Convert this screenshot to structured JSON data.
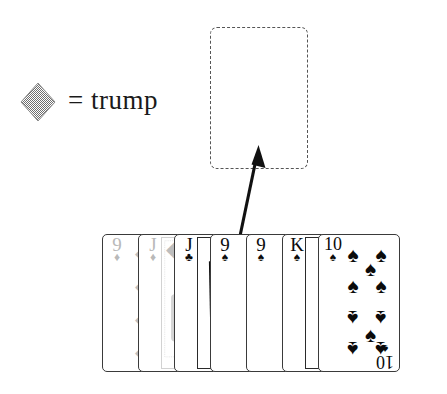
{
  "figure": {
    "legend": {
      "symbol_name": "diamond-suit",
      "symbol_char": "♦",
      "symbol_color": "#9e9e9e",
      "text": "= trump"
    },
    "placeholder": {
      "label": "",
      "style": "dashed-rounded-rectangle",
      "meaning": "empty card slot"
    },
    "arrow": {
      "label": "",
      "direction": "up",
      "from_card_index": 3,
      "points_to": "placeholder"
    },
    "hand": {
      "label": "",
      "cards": [
        {
          "rank": "9",
          "suit": "♦",
          "suit_name": "diamonds",
          "color": "#c9c9c9",
          "type": "pip",
          "pip_count": 4,
          "visible": "partial"
        },
        {
          "rank": "J",
          "suit": "♦",
          "suit_name": "diamonds",
          "color": "#c9c9c9",
          "type": "face",
          "pip_count": 0,
          "visible": "partial"
        },
        {
          "rank": "J",
          "suit": "♣",
          "suit_name": "clubs",
          "color": "#0b0b0b",
          "type": "face",
          "pip_count": 0,
          "visible": "partial"
        },
        {
          "rank": "9",
          "suit": "♠",
          "suit_name": "spades",
          "color": "#0b0b0b",
          "type": "pip",
          "pip_count": 4,
          "visible": "partial"
        },
        {
          "rank": "9",
          "suit": "♠",
          "suit_name": "spades",
          "color": "#0b0b0b",
          "type": "pip",
          "pip_count": 4,
          "visible": "partial"
        },
        {
          "rank": "K",
          "suit": "♠",
          "suit_name": "spades",
          "color": "#0b0b0b",
          "type": "face",
          "pip_count": 0,
          "visible": "partial"
        },
        {
          "rank": "10",
          "suit": "♠",
          "suit_name": "spades",
          "color": "#0b0b0b",
          "type": "pip",
          "pip_count": 10,
          "visible": "full"
        }
      ]
    },
    "colors": {
      "ink": "#0b0b0b",
      "card_border": "#3a3a3a",
      "trump_gray": "#9e9e9e",
      "faded_card": "#c9c9c9",
      "dashed": "#555555",
      "background": "#ffffff"
    }
  }
}
